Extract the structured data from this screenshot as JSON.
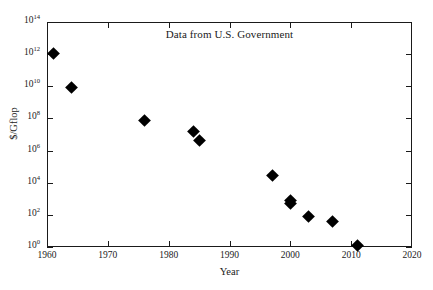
{
  "chart_data": {
    "type": "scatter",
    "title": "Data from U.S. Government",
    "xlabel": "Year",
    "ylabel": "$/Gflop",
    "xlim": [
      1960,
      2020
    ],
    "ylim": [
      1,
      100000000000000.0
    ],
    "yscale": "log",
    "xscale": "linear",
    "grid": false,
    "legend": null,
    "xticks": [
      1960,
      1970,
      1980,
      1990,
      2000,
      2010,
      2020
    ],
    "xtick_labels": [
      "1960",
      "1970",
      "1980",
      "1990",
      "2000",
      "2010",
      "2020"
    ],
    "yticks": [
      1,
      100,
      10000,
      1000000,
      100000000,
      10000000000,
      1000000000000,
      100000000000000
    ],
    "ytick_labels": [
      "10⁰",
      "10²",
      "10⁴",
      "10⁶",
      "10⁸",
      "10¹⁰",
      "10¹²",
      "10¹⁴"
    ],
    "ytick_exponents": [
      "0",
      "2",
      "4",
      "6",
      "8",
      "10",
      "12",
      "14"
    ],
    "marker": "diamond",
    "marker_color": "#000000",
    "points": [
      {
        "x": 1961,
        "y": 1100000000000.0
      },
      {
        "x": 1964,
        "y": 8000000000.0
      },
      {
        "x": 1976,
        "y": 70000000.0
      },
      {
        "x": 1984,
        "y": 15000000.0
      },
      {
        "x": 1985,
        "y": 4000000.0
      },
      {
        "x": 1997,
        "y": 30000.0
      },
      {
        "x": 2000,
        "y": 800.0
      },
      {
        "x": 2000,
        "y": 500.0
      },
      {
        "x": 2003,
        "y": 80.0
      },
      {
        "x": 2007,
        "y": 40.0
      },
      {
        "x": 2011,
        "y": 1.3
      }
    ]
  },
  "figure": {
    "background": "#ffffff",
    "axis_color": "#1a1a1a",
    "accent": "#000000"
  }
}
